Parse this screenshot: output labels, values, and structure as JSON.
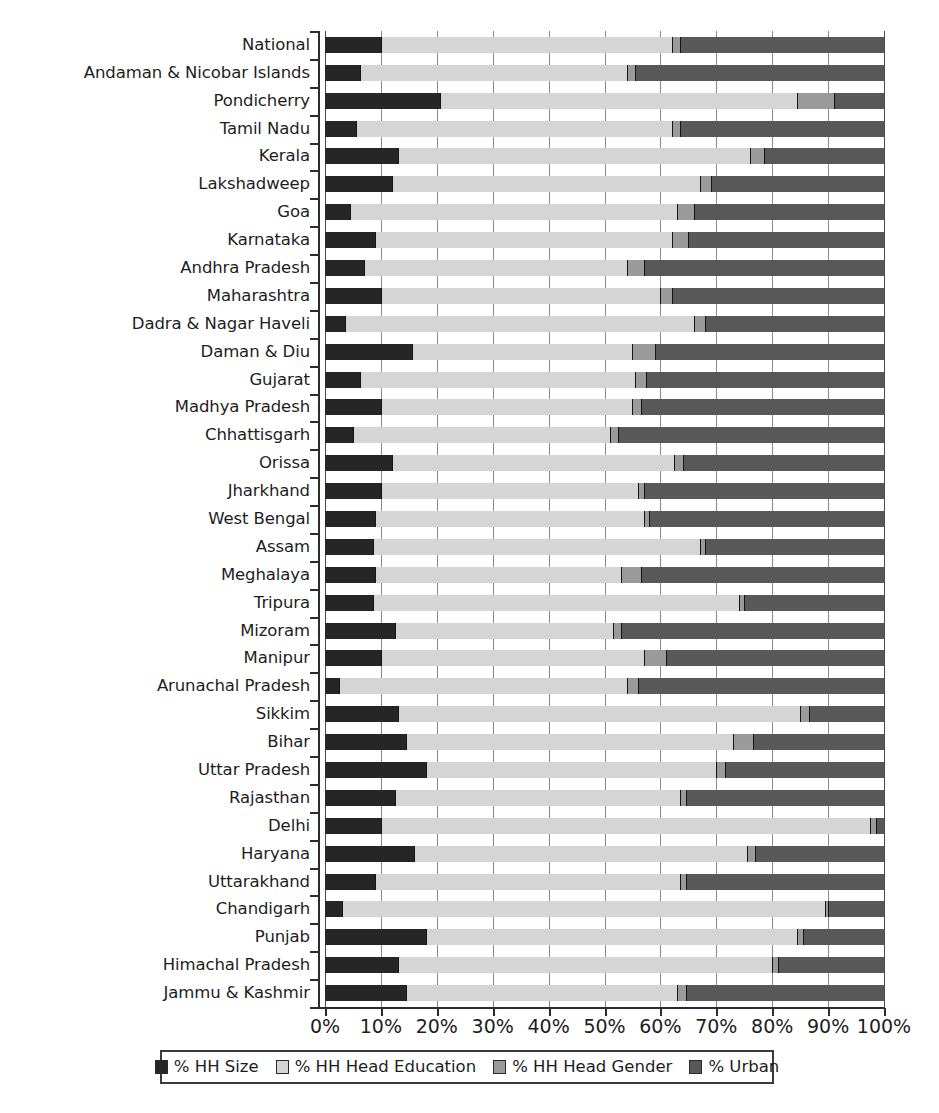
{
  "chart_data": {
    "type": "bar",
    "orientation": "horizontal",
    "stacked": true,
    "normalized": true,
    "title": "",
    "subtitle": "",
    "xlabel": "",
    "ylabel": "",
    "xlim": [
      0,
      100
    ],
    "xticks": [
      "0%",
      "10%",
      "20%",
      "30%",
      "40%",
      "50%",
      "60%",
      "70%",
      "80%",
      "90%",
      "100%"
    ],
    "xtick_values": [
      0,
      10,
      20,
      30,
      40,
      50,
      60,
      70,
      80,
      90,
      100
    ],
    "grid": "vertical",
    "legend_position": "bottom",
    "series": [
      {
        "name": "% HH Size",
        "color": "#262626",
        "values": [
          10.0,
          6.2,
          20.5,
          5.5,
          13.0,
          12.0,
          4.5,
          9.0,
          7.0,
          10.0,
          3.5,
          15.5,
          6.2,
          10.0,
          5.0,
          12.0,
          10.0,
          9.0,
          8.5,
          9.0,
          8.5,
          12.5,
          10.0,
          2.5,
          13.0,
          14.5,
          18.0,
          12.5,
          10.0,
          16.0,
          9.0,
          3.0,
          18.0,
          13.0,
          14.5
        ]
      },
      {
        "name": "% HH Head Education",
        "color": "#d5d5d5",
        "values": [
          52.0,
          47.8,
          64.0,
          56.5,
          63.0,
          55.0,
          58.5,
          53.0,
          47.0,
          50.0,
          62.5,
          39.5,
          49.3,
          45.0,
          46.0,
          50.5,
          46.0,
          48.0,
          58.5,
          44.0,
          65.5,
          39.0,
          47.0,
          51.5,
          72.0,
          58.5,
          52.0,
          51.0,
          87.5,
          59.5,
          54.5,
          86.5,
          66.5,
          67.0,
          48.5
        ]
      },
      {
        "name": "% HH Head Gender",
        "color": "#9a9a9a",
        "values": [
          1.5,
          1.5,
          6.5,
          1.5,
          2.5,
          2.0,
          3.0,
          3.0,
          3.0,
          2.0,
          2.0,
          4.0,
          2.0,
          1.5,
          1.5,
          1.5,
          1.0,
          1.0,
          1.0,
          3.5,
          1.0,
          1.5,
          4.0,
          2.0,
          1.5,
          3.5,
          1.5,
          1.0,
          1.0,
          1.5,
          1.0,
          0.5,
          1.0,
          1.0,
          1.5
        ]
      },
      {
        "name": "% Urban",
        "color": "#585858",
        "values": [
          36.5,
          44.5,
          9.0,
          36.5,
          21.5,
          31.0,
          34.0,
          35.0,
          43.0,
          38.0,
          32.0,
          41.0,
          42.5,
          43.5,
          47.5,
          36.0,
          43.0,
          42.0,
          32.0,
          43.5,
          25.0,
          47.0,
          39.0,
          44.0,
          13.5,
          23.5,
          28.5,
          35.5,
          1.5,
          23.0,
          35.5,
          10.0,
          14.5,
          19.0,
          35.5
        ]
      }
    ],
    "categories": [
      "National",
      "Andaman & Nicobar Islands",
      "Pondicherry",
      "Tamil Nadu",
      "Kerala",
      "Lakshadweep",
      "Goa",
      "Karnataka",
      "Andhra Pradesh",
      "Maharashtra",
      "Dadra & Nagar Haveli",
      "Daman & Diu",
      "Gujarat",
      "Madhya Pradesh",
      "Chhattisgarh",
      "Orissa",
      "Jharkhand",
      "West Bengal",
      "Assam",
      "Meghalaya",
      "Tripura",
      "Mizoram",
      "Manipur",
      "Arunachal Pradesh",
      "Sikkim",
      "Bihar",
      "Uttar Pradesh",
      "Rajasthan",
      "Delhi",
      "Haryana",
      "Uttarakhand",
      "Chandigarh",
      "Punjab",
      "Himachal Pradesh",
      "Jammu & Kashmir"
    ]
  },
  "legend": {
    "items": [
      {
        "label": "% HH Size",
        "color": "#262626",
        "icon": "square-swatch-icon"
      },
      {
        "label": "% HH Head Education",
        "color": "#d5d5d5",
        "icon": "square-swatch-icon"
      },
      {
        "label": "% HH Head Gender",
        "color": "#9a9a9a",
        "icon": "square-swatch-icon"
      },
      {
        "label": "% Urban",
        "color": "#585858",
        "icon": "square-swatch-icon"
      }
    ]
  }
}
